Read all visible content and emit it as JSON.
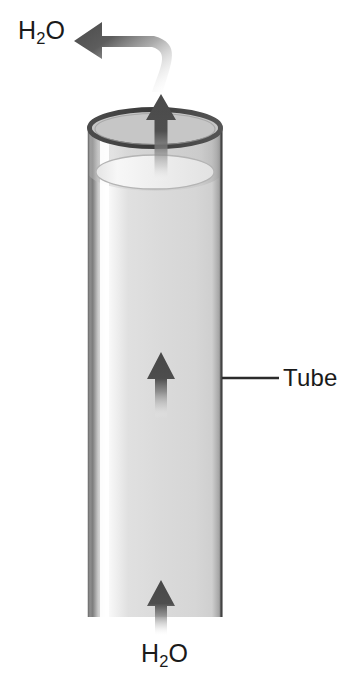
{
  "figure": {
    "background_color": "#ffffff"
  },
  "labels": {
    "h2o_top": {
      "formula": "H",
      "subscript": "2",
      "suffix": "O",
      "text": "H2O"
    },
    "h2o_bottom": {
      "formula": "H",
      "subscript": "2",
      "suffix": "O",
      "text": "H2O"
    },
    "tube": {
      "text": "Tube"
    }
  },
  "colors": {
    "outline_dark": "#3a3a3a",
    "rim_stroke": "#4a4a4a",
    "glass_edge": "#8e8e8e",
    "glass_body": "#d8d8d8",
    "glass_highlight": "#ffffff",
    "water_surface": "#e9e9e9",
    "arrow_dark": "#4d4d4d",
    "arrow_fade": "#ffffff",
    "text": "#1a1a1a",
    "leader_line": "#2b2b2b"
  },
  "geometry": {
    "canvas": {
      "width": 347,
      "height": 687
    },
    "tube": {
      "left_x": 88,
      "right_x": 222,
      "top_y": 128,
      "bottom_y": 617,
      "rim_ellipse_ry": 19,
      "water_surface_y": 172,
      "water_ellipse_ry": 17,
      "bottom_cutoff": true
    },
    "leader_line": {
      "x1": 222,
      "x2": 279,
      "y": 378
    }
  },
  "arrows": [
    {
      "name": "top-exit-arrow",
      "direction": "up",
      "tip_y": 96,
      "tail_y": 182,
      "center_x": 161,
      "fades": "tail"
    },
    {
      "name": "middle-flow-arrow",
      "direction": "up",
      "tip_y": 353,
      "tail_y": 418,
      "center_x": 161,
      "fades": "tail"
    },
    {
      "name": "bottom-intake-arrow",
      "direction": "up",
      "tip_y": 581,
      "tail_y": 636,
      "center_x": 161,
      "fades": "tail"
    },
    {
      "name": "evaporation-curved-arrow",
      "direction": "left",
      "tip_x": 74,
      "tip_y": 34,
      "origin_x": 164,
      "origin_y": 90,
      "fades": "tail"
    }
  ]
}
